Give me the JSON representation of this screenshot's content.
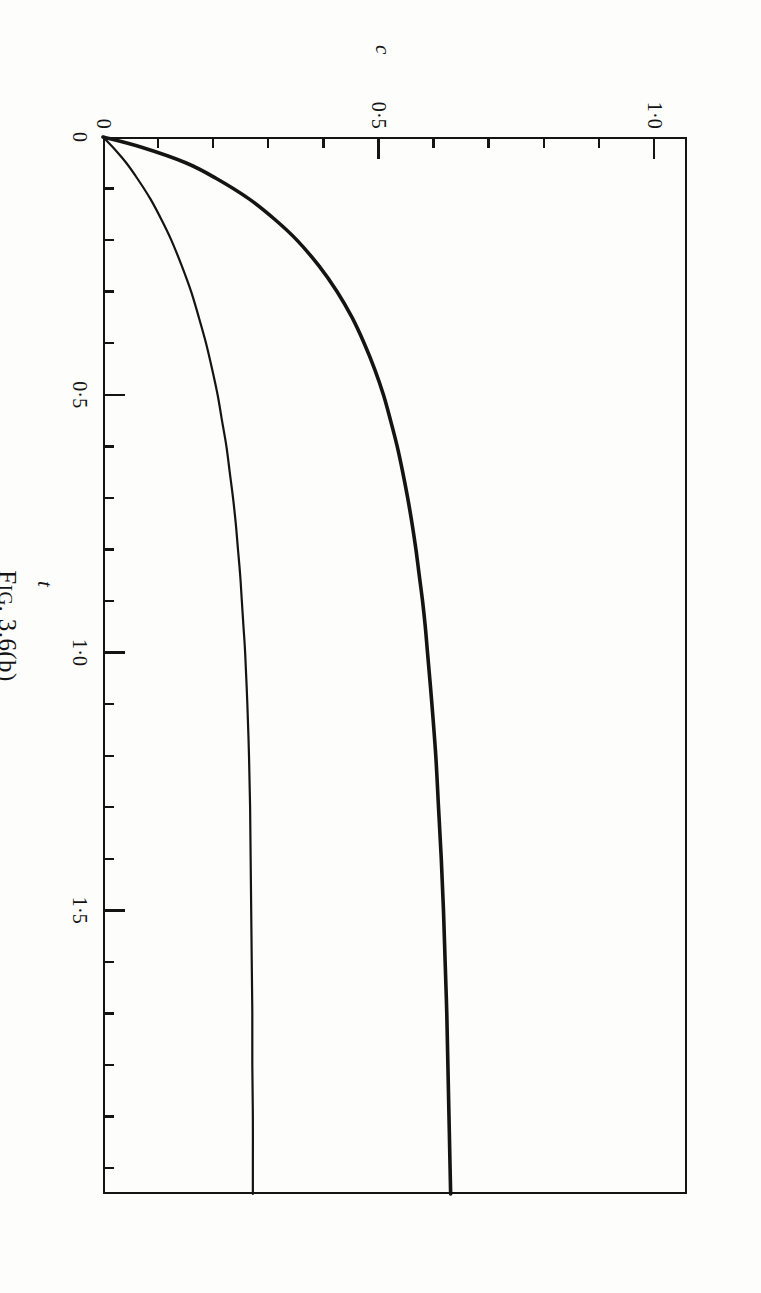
{
  "figure": {
    "caption_prefix": "F",
    "caption_smallcaps": "IG",
    "caption_rest": ". 3.6(b)"
  },
  "axes": {
    "x": {
      "label": "t",
      "min": 0,
      "max": 2.05,
      "major_ticks": [
        {
          "value": 0,
          "label": "0"
        },
        {
          "value": 0.5,
          "label": "0·5"
        },
        {
          "value": 1.0,
          "label": "1·0"
        },
        {
          "value": 1.5,
          "label": "1·5"
        }
      ],
      "minor_step": 0.1
    },
    "y": {
      "label": "c",
      "min": 0,
      "max": 1.06,
      "major_ticks": [
        {
          "value": 0,
          "label": "0"
        },
        {
          "value": 0.5,
          "label": "0·5"
        },
        {
          "value": 1.0,
          "label": "1·0"
        }
      ],
      "minor_step": 0.1
    }
  },
  "style": {
    "ink": "#141414",
    "paper": "#fdfdfc",
    "curve_upper_width": 3.6,
    "curve_lower_width": 2.2
  },
  "chart_data": {
    "type": "line",
    "title": "",
    "xlabel": "t",
    "ylabel": "c",
    "xlim": [
      0,
      2.05
    ],
    "ylim": [
      0,
      1.06
    ],
    "grid": false,
    "legend": "none",
    "xticks": [
      0,
      0.5,
      1.0,
      1.5
    ],
    "xticklabels": [
      "0",
      "0·5",
      "1·0",
      "1·5"
    ],
    "yticks": [
      0,
      0.5,
      1.0
    ],
    "yticklabels": [
      "0",
      "0·5",
      "1·0"
    ],
    "series": [
      {
        "name": "upper curve",
        "asymptote": 0.635,
        "x": [
          0,
          0.02,
          0.05,
          0.08,
          0.12,
          0.16,
          0.2,
          0.25,
          0.3,
          0.35,
          0.4,
          0.45,
          0.5,
          0.55,
          0.6,
          0.65,
          0.7,
          0.75,
          0.8,
          0.85,
          0.9,
          0.95,
          1.0,
          1.1,
          1.2,
          1.3,
          1.4,
          1.5,
          1.6,
          1.7,
          1.8,
          1.9,
          2.0,
          2.05
        ],
        "values": [
          0.0,
          0.07,
          0.15,
          0.205,
          0.265,
          0.312,
          0.352,
          0.392,
          0.425,
          0.452,
          0.474,
          0.493,
          0.509,
          0.522,
          0.534,
          0.544,
          0.553,
          0.561,
          0.568,
          0.574,
          0.58,
          0.585,
          0.589,
          0.597,
          0.604,
          0.609,
          0.614,
          0.618,
          0.621,
          0.624,
          0.626,
          0.628,
          0.63,
          0.631
        ]
      },
      {
        "name": "lower curve",
        "asymptote": 0.272,
        "x": [
          0,
          0.02,
          0.05,
          0.08,
          0.12,
          0.16,
          0.2,
          0.25,
          0.3,
          0.35,
          0.4,
          0.45,
          0.5,
          0.55,
          0.6,
          0.65,
          0.7,
          0.75,
          0.8,
          0.85,
          0.9,
          0.95,
          1.0,
          1.1,
          1.2,
          1.3,
          1.4,
          1.5,
          1.6,
          1.7,
          1.8,
          1.9,
          2.0,
          2.05
        ],
        "values": [
          0.0,
          0.018,
          0.042,
          0.062,
          0.086,
          0.106,
          0.124,
          0.143,
          0.16,
          0.174,
          0.187,
          0.198,
          0.208,
          0.216,
          0.224,
          0.23,
          0.236,
          0.241,
          0.245,
          0.249,
          0.252,
          0.255,
          0.258,
          0.262,
          0.265,
          0.267,
          0.268,
          0.269,
          0.27,
          0.271,
          0.271,
          0.272,
          0.272,
          0.272
        ]
      }
    ]
  }
}
